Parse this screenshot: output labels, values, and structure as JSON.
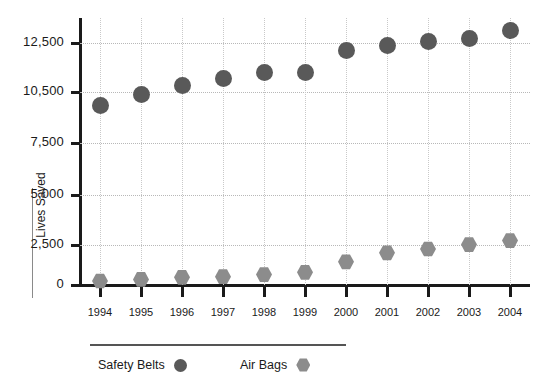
{
  "chart_data": {
    "type": "scatter",
    "title": "",
    "xlabel": "",
    "ylabel": "Lives Saved",
    "grid": true,
    "legend_position": "bottom",
    "categories": [
      "1994",
      "1995",
      "1996",
      "1997",
      "1998",
      "1999",
      "2000",
      "2001",
      "2002",
      "2003",
      "2004"
    ],
    "y_ticks": [
      0,
      2500,
      5000,
      7500,
      10500,
      12500
    ],
    "y_tick_labels": [
      "0",
      "2,500",
      "5,000",
      "7,500",
      "10,500",
      "12,500"
    ],
    "ylim": [
      0,
      13500
    ],
    "series": [
      {
        "name": "Safety Belts",
        "marker": "circle",
        "color": "#595959",
        "values": [
          9700,
          10350,
          10750,
          11050,
          11300,
          11300,
          12200,
          12400,
          12550,
          12700,
          13000
        ]
      },
      {
        "name": "Air Bags",
        "marker": "hexagon",
        "color": "#8c8c8c",
        "values": [
          250,
          350,
          480,
          520,
          650,
          790,
          1450,
          2010,
          2250,
          2520,
          2720
        ]
      }
    ]
  },
  "axis": {
    "y_title": "Lives Saved"
  },
  "legend": {
    "items": [
      {
        "label": "Safety Belts",
        "marker": "circle",
        "color": "#595959"
      },
      {
        "label": "Air Bags",
        "marker": "hexagon",
        "color": "#8c8c8c"
      }
    ]
  },
  "colors": {
    "safety_belts": "#595959",
    "air_bags": "#8c8c8c",
    "axis": "#1a1a1a",
    "grid": "#b8b8b8",
    "background": "#ffffff"
  }
}
